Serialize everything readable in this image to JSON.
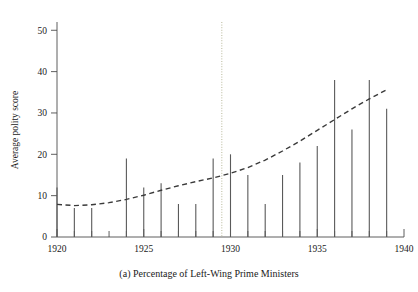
{
  "figure": {
    "caption": "(a) Percentage of Left-Wing Prime Ministers",
    "background_color": "#ffffff",
    "bar_color": "#5a5a5a",
    "trend_color": "#3a3a3a",
    "vline_color": "#b8b89a",
    "axis_color": "#4d4d4d"
  },
  "chart_data": {
    "type": "bar",
    "title": "",
    "subtitle": "",
    "caption": "(a) Percentage of Left-Wing Prime Ministers",
    "xlabel": "",
    "ylabel": "Average polity score",
    "xlim": [
      1920,
      1940
    ],
    "ylim": [
      0,
      52
    ],
    "grid": false,
    "legend": null,
    "xtick_labels": [
      "1920",
      "1925",
      "1930",
      "1935",
      "1940"
    ],
    "xtick_values": [
      1920,
      1925,
      1930,
      1935,
      1940
    ],
    "xtick_minor_values": [
      1921,
      1922,
      1923,
      1924,
      1926,
      1927,
      1928,
      1929,
      1931,
      1932,
      1933,
      1934,
      1936,
      1937,
      1938,
      1939
    ],
    "ytick_labels": [
      "0",
      "10",
      "20",
      "30",
      "40",
      "50"
    ],
    "ytick_values": [
      0,
      10,
      20,
      30,
      40,
      50
    ],
    "categories": [
      1920,
      1921,
      1922,
      1924,
      1925,
      1926,
      1927,
      1928,
      1929,
      1930,
      1931,
      1932,
      1933,
      1934,
      1935,
      1936,
      1937,
      1938,
      1939
    ],
    "values": [
      12,
      7,
      7,
      19,
      12,
      13,
      8,
      8,
      19,
      20,
      15,
      8,
      15,
      18,
      22,
      38,
      26,
      38,
      31
    ],
    "series": [
      {
        "name": "Average polity score",
        "values": [
          12,
          7,
          7,
          19,
          12,
          13,
          8,
          8,
          19,
          20,
          15,
          8,
          15,
          18,
          22,
          38,
          26,
          38,
          31
        ]
      }
    ],
    "annotations": [
      {
        "type": "vertical-line",
        "x": 1929.5,
        "style": "dotted",
        "label": ""
      }
    ],
    "trend_line": {
      "name": "fitted trend",
      "style": "dashed",
      "x": [
        1920,
        1921,
        1922,
        1923,
        1924,
        1925,
        1926,
        1927,
        1928,
        1929,
        1930,
        1931,
        1932,
        1933,
        1934,
        1935,
        1936,
        1937,
        1938,
        1939
      ],
      "y": [
        7.9,
        7.6,
        7.8,
        8.3,
        9.1,
        10.1,
        11.3,
        12.4,
        13.4,
        14.3,
        15.4,
        16.8,
        18.6,
        20.8,
        23.2,
        25.8,
        28.4,
        31.0,
        33.4,
        35.6
      ]
    }
  },
  "labels": {
    "y_axis_title": "Average polity score",
    "x_caption": "(a) Percentage of Left-Wing Prime Ministers"
  }
}
